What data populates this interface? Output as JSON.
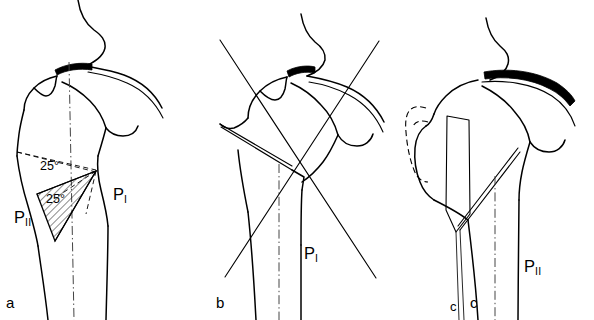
{
  "figure": {
    "kind": "anatomical-line-drawing",
    "panels": [
      {
        "id": "a",
        "letter": "a",
        "name": "preoperative-planning",
        "labels": [
          {
            "name": "angle-upper",
            "text": "25°"
          },
          {
            "name": "angle-lower",
            "text": "25°"
          },
          {
            "name": "plane-one",
            "base": "P",
            "sub": "I"
          },
          {
            "name": "plane-two",
            "base": "P",
            "sub": "II"
          }
        ]
      },
      {
        "id": "b",
        "letter": "b",
        "name": "osteotomy-cut-lines",
        "labels": [
          {
            "name": "plane-one",
            "base": "P",
            "sub": "I"
          }
        ]
      },
      {
        "id": "c",
        "letter": "c",
        "name": "postoperative-result",
        "labels": [
          {
            "name": "chisel-marker",
            "text": "c"
          },
          {
            "name": "plane-two",
            "base": "P",
            "sub": "II"
          }
        ]
      }
    ]
  },
  "panel_a": {
    "letter": "a",
    "angle_upper": "25°",
    "angle_lower": "25°",
    "p_one_base": "P",
    "p_one_sub": "I",
    "p_two_base": "P",
    "p_two_sub": "II"
  },
  "panel_b": {
    "letter": "b",
    "p_one_base": "P",
    "p_one_sub": "I"
  },
  "panel_c": {
    "letter": "c",
    "chisel_marker": "c",
    "p_two_base": "P",
    "p_two_sub": "II"
  },
  "colors": {
    "background": "#ffffff",
    "ink": "#000000",
    "axis_line": "#444444"
  }
}
